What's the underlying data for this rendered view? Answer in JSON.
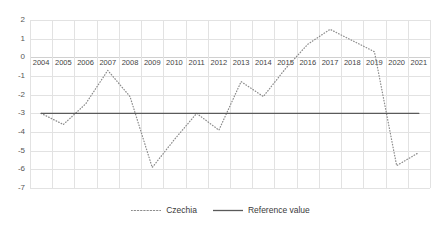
{
  "chart_data": {
    "type": "line",
    "title": "",
    "xlabel": "",
    "ylabel": "",
    "categories": [
      "2004",
      "2005",
      "2006",
      "2007",
      "2008",
      "2009",
      "2010",
      "2011",
      "2012",
      "2013",
      "2014",
      "2015",
      "2016",
      "2017",
      "2018",
      "2019",
      "2020",
      "2021"
    ],
    "series": [
      {
        "name": "Czechia",
        "style": "dotted",
        "color": "#8c8c8c",
        "values": [
          -3.0,
          -3.6,
          -2.5,
          -0.7,
          -2.1,
          -5.9,
          -4.4,
          -3.0,
          -3.9,
          -1.3,
          -2.1,
          -0.6,
          0.7,
          1.5,
          0.9,
          0.3,
          -5.8,
          -5.1
        ]
      },
      {
        "name": "Reference value",
        "style": "solid",
        "color": "#5a5a5a",
        "values": [
          -3.0,
          -3.0,
          -3.0,
          -3.0,
          -3.0,
          -3.0,
          -3.0,
          -3.0,
          -3.0,
          -3.0,
          -3.0,
          -3.0,
          -3.0,
          -3.0,
          -3.0,
          -3.0,
          -3.0,
          -3.0
        ]
      }
    ],
    "yticks": [
      2,
      1,
      0,
      -1,
      -2,
      -3,
      -4,
      -5,
      -6,
      -7
    ],
    "ylim": [
      -7,
      2
    ],
    "grid": true,
    "legend_position": "bottom",
    "gridline_color": "#e2e2e2"
  },
  "legend": {
    "items": [
      {
        "label": "Czechia"
      },
      {
        "label": "Reference value"
      }
    ]
  }
}
